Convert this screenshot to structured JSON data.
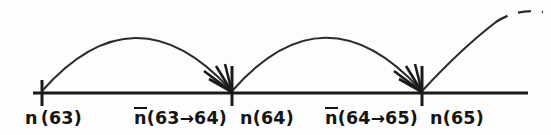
{
  "figure": {
    "background_color": "#fdfdfd",
    "stroke_color": "#1a1a1a",
    "width": 551,
    "height": 135
  },
  "axis": {
    "name": "horizontal-number-line",
    "y": 93,
    "x_start": 33,
    "x_end": 528
  },
  "ticks": [
    {
      "id": "tick-n63",
      "x": 42,
      "top": 80,
      "bottom": 106,
      "has_arrowhead": false
    },
    {
      "id": "tick-n64",
      "x": 232,
      "top": 66,
      "bottom": 106,
      "has_arrowhead": true
    },
    {
      "id": "tick-n65",
      "x": 422,
      "top": 66,
      "bottom": 106,
      "has_arrowhead": true
    }
  ],
  "arcs": [
    {
      "id": "arc-63-to-64",
      "from_x": 42,
      "to_x": 232,
      "peak_x": 135,
      "peak_y": 20,
      "dashed": false
    },
    {
      "id": "arc-64-to-65",
      "from_x": 232,
      "to_x": 422,
      "peak_x": 325,
      "peak_y": 20,
      "dashed": false
    },
    {
      "id": "arc-65-onward",
      "from_x": 422,
      "to_x": 540,
      "peak_x": 512,
      "peak_y": 14,
      "dashed": true,
      "dash_start_x": 495
    }
  ],
  "labels": [
    {
      "id": "label-n63",
      "name": "label-n-63",
      "prefix": "n",
      "overbar": false,
      "spaced": true,
      "body_open": "(",
      "from": "63",
      "arrow": "",
      "to": "",
      "body_close": ")",
      "text": "n (63)",
      "x": 25,
      "y": 110
    },
    {
      "id": "label-nbar-63-64",
      "name": "label-nbar-63-to-64",
      "prefix": "n",
      "overbar": true,
      "spaced": false,
      "body_open": "(",
      "from": "63",
      "arrow": "→",
      "to": "64",
      "body_close": ")",
      "text": "n̄(63→64)",
      "x": 134,
      "y": 110
    },
    {
      "id": "label-n64",
      "name": "label-n-64",
      "prefix": "n",
      "overbar": false,
      "spaced": false,
      "body_open": "(",
      "from": "64",
      "arrow": "",
      "to": "",
      "body_close": ")",
      "text": "n(64)",
      "x": 240,
      "y": 110
    },
    {
      "id": "label-nbar-64-65",
      "name": "label-nbar-64-to-65",
      "prefix": "n",
      "overbar": true,
      "spaced": false,
      "body_open": "(",
      "from": "64",
      "arrow": "→",
      "to": "65",
      "body_close": ")",
      "text": "n̄(64→65)",
      "x": 325,
      "y": 110
    },
    {
      "id": "label-n65",
      "name": "label-n-65",
      "prefix": "n",
      "overbar": false,
      "spaced": false,
      "body_open": "(",
      "from": "65",
      "arrow": "",
      "to": "",
      "body_close": ")",
      "text": "n(65)",
      "x": 430,
      "y": 110
    }
  ]
}
